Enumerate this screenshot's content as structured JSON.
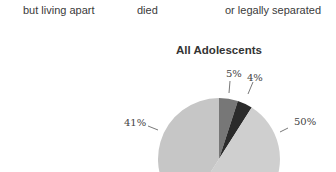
{
  "legend": {
    "labels": [
      "but living apart",
      "died",
      "or legally separated"
    ]
  },
  "chart_data": {
    "type": "pie",
    "title": "All Adolescents",
    "slices": [
      {
        "label": "5%",
        "value": 5,
        "color": "#777777"
      },
      {
        "label": "4%",
        "value": 4,
        "color": "#2b2b2b"
      },
      {
        "label": "50%",
        "value": 50,
        "color": "#cfcfcf"
      },
      {
        "label": "41%",
        "value": 41,
        "color": "#c6c6c6"
      }
    ],
    "legend_fragments": [
      "but living apart",
      "died",
      "or legally separated"
    ]
  }
}
